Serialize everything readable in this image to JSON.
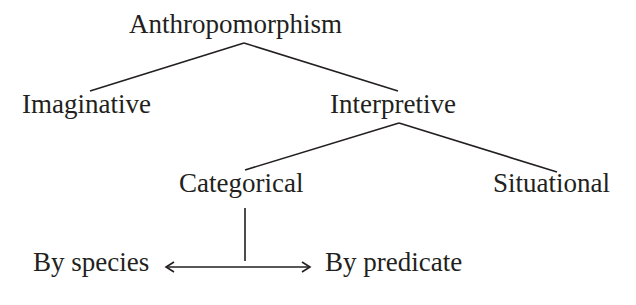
{
  "diagram": {
    "nodes": {
      "root": "Anthropomorphism",
      "imaginative": "Imaginative",
      "interpretive": "Interpretive",
      "categorical": "Categorical",
      "situational": "Situational",
      "by_species": "By species",
      "by_predicate": "By predicate"
    },
    "edges": [
      {
        "from": "Anthropomorphism",
        "to": "Imaginative",
        "type": "line"
      },
      {
        "from": "Anthropomorphism",
        "to": "Interpretive",
        "type": "line"
      },
      {
        "from": "Interpretive",
        "to": "Categorical",
        "type": "line"
      },
      {
        "from": "Interpretive",
        "to": "Situational",
        "type": "line"
      },
      {
        "from": "Categorical",
        "to": "By species / By predicate",
        "type": "line-to-double-arrow"
      },
      {
        "from": "By species",
        "to": "By predicate",
        "type": "double-headed-arrow"
      }
    ],
    "colors": {
      "ink": "#231f20",
      "background": "#ffffff"
    }
  }
}
